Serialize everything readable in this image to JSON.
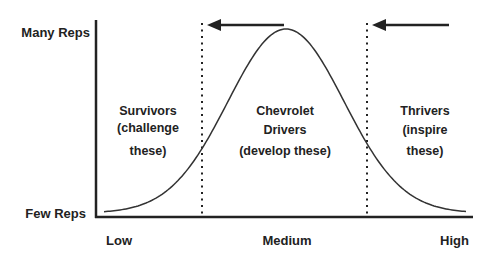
{
  "diagram": {
    "y_axis": {
      "top_label": "Many Reps",
      "bottom_label": "Few Reps"
    },
    "x_axis": {
      "labels": [
        "Low",
        "Medium",
        "High"
      ]
    },
    "regions": [
      {
        "id": "survivors",
        "lines": [
          "Survivors",
          "(challenge",
          "these)"
        ]
      },
      {
        "id": "chevrolet-drivers",
        "lines": [
          "Chevrolet",
          "Drivers",
          "(develop these)"
        ]
      },
      {
        "id": "thrivers",
        "lines": [
          "Thrivers",
          "(inspire",
          "these)"
        ]
      }
    ],
    "arrows": [
      {
        "id": "shift-left-arrow-1",
        "direction": "left"
      },
      {
        "id": "shift-left-arrow-2",
        "direction": "left"
      }
    ],
    "curve": {
      "type": "bell",
      "description": "normal distribution"
    },
    "colors": {
      "ink": "#222222",
      "curve": "#333333"
    }
  }
}
